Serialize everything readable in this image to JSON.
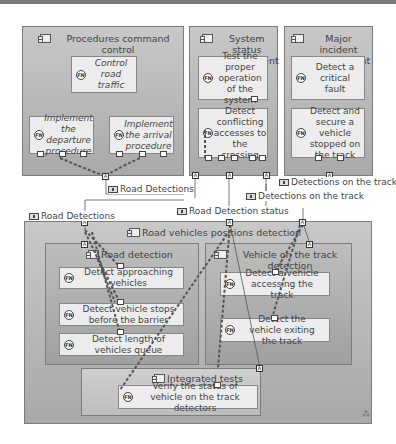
{
  "containers": {
    "procedures": {
      "title": "Procedures command control"
    },
    "system_status": {
      "title": "System status management"
    },
    "major_incident": {
      "title": "Major incident management"
    },
    "road_vehicles": {
      "title": "Road vehicles positions detection"
    },
    "road_detection": {
      "title": "Road detection"
    },
    "vehicle_on_track": {
      "title": "Vehicle on the track detection"
    },
    "integrated_tests": {
      "title": "Integrated tests"
    }
  },
  "functions": {
    "control_road_traffic": "Control road traffic",
    "implement_departure": "Implement the departure procedure",
    "implement_arrival": "Implement the arrival procedure",
    "test_proper_operation": "Test the proper operation of the system",
    "detect_conflicting": "Detect conflicting accesses to the crossing",
    "detect_critical_fault": "Detect a critical fault",
    "detect_secure_vehicle": "Detect and secure a vehicle stopped on the track",
    "detect_approaching": "Detect approaching vehicles",
    "detect_stops_before_barrier": "Detect vehicle stops before the barrier",
    "detect_length_queue": "Detect length of vehicles queue",
    "detect_accessing_track": "Detect a vehicle accessing the track",
    "detect_exiting_track": "Detect the vehicle exiting the track",
    "verify_status": "Verify the status of vehicle on the track detectors"
  },
  "exchange_labels": {
    "road_detections_1": "Road Detections",
    "road_detections_2": "Road Detections",
    "road_detection_status": "Road Detection status",
    "detections_on_track_1": "Detections on the track",
    "detections_on_track_2": "Detections on the track"
  },
  "icons": {
    "function": "FN",
    "port": "A"
  }
}
